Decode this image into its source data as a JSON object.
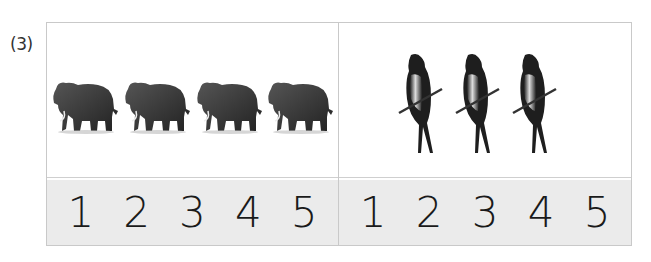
{
  "question": {
    "label": "(3)"
  },
  "panels": [
    {
      "animal": "elephant",
      "count_shown": 4,
      "options": [
        "1",
        "2",
        "3",
        "4",
        "5"
      ]
    },
    {
      "animal": "swallow",
      "count_shown": 3,
      "options": [
        "1",
        "2",
        "3",
        "4",
        "5"
      ]
    }
  ],
  "colors": {
    "border": "#c9c9c9",
    "number_band": "#ebebeb",
    "digit": "#1a1a1a"
  }
}
